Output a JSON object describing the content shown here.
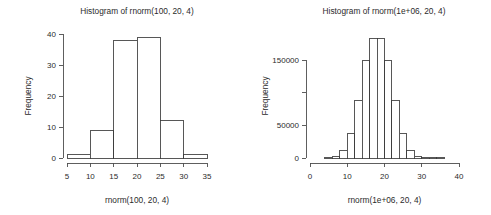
{
  "figure": {
    "background_color": "#ffffff",
    "foreground_color": "#2b2b2b",
    "layout": "1 row x 2 columns",
    "panel_count": 2
  },
  "chart_data": [
    {
      "type": "bar",
      "subtype": "histogram",
      "panel": "left",
      "title": "Histogram of rnorm(100, 20, 4)",
      "xlabel": "rnorm(100, 20, 4)",
      "ylabel": "Frequency",
      "bin_width": 5,
      "bin_edges": [
        5,
        10,
        15,
        20,
        25,
        30,
        35
      ],
      "categories": [
        "5-10",
        "10-15",
        "15-20",
        "20-25",
        "25-30",
        "30-35"
      ],
      "values": [
        1,
        9,
        38,
        39,
        12,
        1
      ],
      "bin_centers": [
        7.5,
        12.5,
        17.5,
        22.5,
        27.5,
        32.5
      ],
      "xlim": [
        5,
        35
      ],
      "ylim": [
        0,
        40
      ],
      "xticks": [
        5,
        10,
        15,
        20,
        25,
        30,
        35
      ],
      "xtick_labels": [
        "5",
        "10",
        "15",
        "20",
        "25",
        "30",
        "35"
      ],
      "yticks": [
        0,
        10,
        20,
        30,
        40
      ],
      "ytick_labels": [
        "0",
        "10",
        "20",
        "30",
        "40"
      ],
      "grid": false,
      "legend": false,
      "bar_fill": "#ffffff",
      "bar_stroke": "#3a3a3a"
    },
    {
      "type": "bar",
      "subtype": "histogram",
      "panel": "right",
      "title": "Histogram of rnorm(1e+06, 20, 4)",
      "xlabel": "rnorm(1e+06, 20, 4)",
      "ylabel": "Frequency",
      "bin_width": 2,
      "bin_edges": [
        4,
        6,
        8,
        10,
        12,
        14,
        16,
        18,
        20,
        22,
        24,
        26,
        28,
        30,
        32,
        34,
        36
      ],
      "categories": [
        "4-6",
        "6-8",
        "8-10",
        "10-12",
        "12-14",
        "14-16",
        "16-18",
        "18-20",
        "20-22",
        "22-24",
        "24-26",
        "26-28",
        "28-30",
        "30-32",
        "32-34",
        "34-36"
      ],
      "values": [
        300,
        2500,
        11000,
        38000,
        88000,
        150000,
        183000,
        183000,
        150000,
        88000,
        38000,
        11000,
        2500,
        300,
        100,
        50
      ],
      "bin_centers": [
        5,
        7,
        9,
        11,
        13,
        15,
        17,
        19,
        21,
        23,
        25,
        27,
        29,
        31,
        33,
        35
      ],
      "xlim": [
        0,
        40
      ],
      "ylim": [
        0,
        190000
      ],
      "xticks": [
        0,
        10,
        20,
        30,
        40
      ],
      "xtick_labels": [
        "0",
        "10",
        "20",
        "30",
        "40"
      ],
      "yticks": [
        0,
        50000,
        100000,
        150000
      ],
      "ytick_labels": [
        "0",
        "50000",
        "",
        "150000"
      ],
      "grid": false,
      "legend": false,
      "bar_fill": "#ffffff",
      "bar_stroke": "#3a3a3a"
    }
  ]
}
